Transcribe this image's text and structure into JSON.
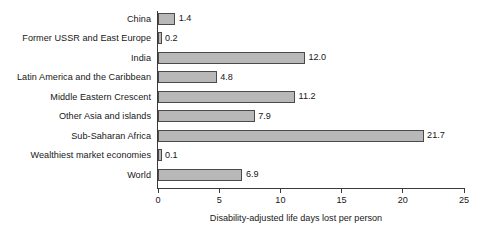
{
  "chart_data": {
    "type": "bar",
    "orientation": "horizontal",
    "title": "",
    "xlabel": "Disability-adjusted life days lost per person",
    "ylabel": "",
    "xlim": [
      0,
      25
    ],
    "xticks": [
      0,
      5,
      10,
      15,
      20,
      25
    ],
    "grid": false,
    "legend": false,
    "bar_color": "#b8b8b8",
    "bar_border_color": "#4a4a4a",
    "axis_color": "#3a3a3a",
    "text_color": "#171717",
    "categories": [
      "China",
      "Former USSR and East Europe",
      "India",
      "Latin America and the Caribbean",
      "Middle Eastern Crescent",
      "Other Asia and islands",
      "Sub-Saharan Africa",
      "Wealthiest market economies",
      "World"
    ],
    "values": [
      1.4,
      0.2,
      12.0,
      4.8,
      11.2,
      7.9,
      21.7,
      0.1,
      6.9
    ],
    "value_labels": [
      "1.4",
      "0.2",
      "12.0",
      "4.8",
      "11.2",
      "7.9",
      "21.7",
      "0.1",
      "6.9"
    ],
    "tick_labels": [
      "0",
      "5",
      "10",
      "15",
      "20",
      "25"
    ]
  }
}
